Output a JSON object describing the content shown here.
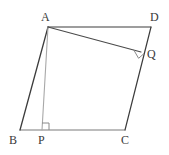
{
  "figure": {
    "width": 169,
    "height": 155,
    "background": "#ffffff",
    "stroke_dark": "#3c3c3c",
    "stroke_mid": "#5a5a5a",
    "stroke_light": "#a8a8a8",
    "label_color": "#3a3a3a"
  },
  "points": [
    {
      "name": "A",
      "label": "A",
      "x": 48,
      "y": 27,
      "label_x": 41,
      "label_y": 11
    },
    {
      "name": "D",
      "label": "D",
      "x": 151,
      "y": 27,
      "label_x": 150,
      "label_y": 11
    },
    {
      "name": "Q",
      "label": "Q",
      "x": 141,
      "y": 52,
      "label_x": 147,
      "label_y": 48
    },
    {
      "name": "B",
      "label": "B",
      "x": 20,
      "y": 130,
      "label_x": 9,
      "label_y": 134
    },
    {
      "name": "P",
      "label": "P",
      "x": 42,
      "y": 130,
      "label_x": 38,
      "label_y": 134
    },
    {
      "name": "C",
      "label": "C",
      "x": 125,
      "y": 130,
      "label_x": 121,
      "label_y": 134
    }
  ],
  "segments": [
    {
      "name": "side-AD",
      "from": "A",
      "to": "D",
      "x1": 48,
      "y1": 27,
      "x2": 151,
      "y2": 27,
      "color": "#3c3c3c",
      "width": 1.2
    },
    {
      "name": "side-DC",
      "from": "D",
      "to": "C",
      "x1": 151,
      "y1": 27,
      "x2": 125,
      "y2": 130,
      "color": "#3c3c3c",
      "width": 1.2
    },
    {
      "name": "side-BC",
      "from": "B",
      "to": "C",
      "x1": 20,
      "y1": 130,
      "x2": 125,
      "y2": 130,
      "color": "#7a7a7a",
      "width": 1.1
    },
    {
      "name": "side-AB",
      "from": "A",
      "to": "B",
      "x1": 48,
      "y1": 27,
      "x2": 20,
      "y2": 130,
      "color": "#3c3c3c",
      "width": 1.3
    },
    {
      "name": "altitude-AP",
      "from": "A",
      "to": "P",
      "x1": 48,
      "y1": 27,
      "x2": 42,
      "y2": 130,
      "color": "#a8a8a8",
      "width": 1.1
    },
    {
      "name": "altitude-AQ",
      "from": "A",
      "to": "Q",
      "x1": 48,
      "y1": 27,
      "x2": 141,
      "y2": 52,
      "color": "#4a4a4a",
      "width": 1.1
    }
  ],
  "right_angles": [
    {
      "name": "right-angle-at-P",
      "at": "P",
      "points": "42,123 49,123 49,130",
      "color": "#8a8a8a"
    },
    {
      "name": "right-angle-at-Q",
      "at": "Q",
      "points": "134,50 139,59 144,54",
      "color": "#8a8a8a"
    }
  ],
  "labels": {
    "A": "A",
    "B": "B",
    "C": "C",
    "D": "D",
    "P": "P",
    "Q": "Q"
  }
}
